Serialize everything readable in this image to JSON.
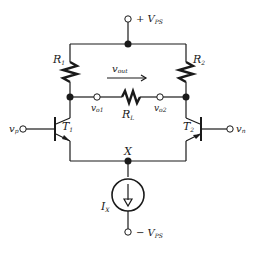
{
  "diagram": {
    "type": "differential-amplifier-circuit",
    "supply_positive": {
      "label": "+ V",
      "sub": "PS"
    },
    "supply_negative": {
      "label": "− V",
      "sub": "PS"
    },
    "resistors": [
      {
        "id": "R1",
        "label": "R",
        "sub": "1"
      },
      {
        "id": "R2",
        "label": "R",
        "sub": "2"
      },
      {
        "id": "RL",
        "label": "R",
        "sub": "L"
      }
    ],
    "transistors": [
      {
        "id": "T1",
        "label": "T",
        "sub": "1"
      },
      {
        "id": "T2",
        "label": "T",
        "sub": "2"
      }
    ],
    "inputs": [
      {
        "id": "vp",
        "label": "v",
        "sub": "p"
      },
      {
        "id": "vn",
        "label": "v",
        "sub": "n"
      }
    ],
    "outputs": [
      {
        "id": "vo1",
        "label": "v",
        "sub": "o1"
      },
      {
        "id": "vo2",
        "label": "v",
        "sub": "o2"
      }
    ],
    "vout": {
      "label": "v",
      "sub": "out"
    },
    "node_x": {
      "label": "X"
    },
    "current_source": {
      "label": "I",
      "sub": "X"
    },
    "colors": {
      "line": "#1a1a1a",
      "background": "#ffffff"
    }
  }
}
